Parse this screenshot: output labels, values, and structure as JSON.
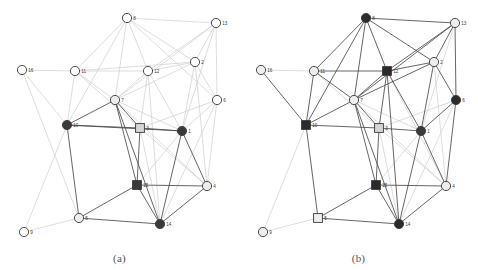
{
  "figure": {
    "panels": [
      {
        "id": "a",
        "caption": "(a)",
        "origin_x": 0,
        "nodes": [
          {
            "id": "1",
            "label": "1",
            "x": 182,
            "y": 131,
            "shape": "circle",
            "fill": "#3a3a3a"
          },
          {
            "id": "2",
            "label": "2",
            "x": 195,
            "y": 62,
            "shape": "circle",
            "fill": "#ffffff"
          },
          {
            "id": "3",
            "label": "3",
            "x": 140,
            "y": 128,
            "shape": "square",
            "fill": "#d5d5d5"
          },
          {
            "id": "4",
            "label": "4",
            "x": 207,
            "y": 186,
            "shape": "circle",
            "fill": "#ededed"
          },
          {
            "id": "5",
            "label": "5",
            "x": 79,
            "y": 218,
            "shape": "circle",
            "fill": "#ededed"
          },
          {
            "id": "6",
            "label": "6",
            "x": 217,
            "y": 100,
            "shape": "circle",
            "fill": "#ffffff"
          },
          {
            "id": "7",
            "label": "7",
            "x": 115,
            "y": 100,
            "shape": "circle",
            "fill": "#ededed"
          },
          {
            "id": "8",
            "label": "8",
            "x": 127,
            "y": 18,
            "shape": "circle",
            "fill": "#ffffff"
          },
          {
            "id": "9",
            "label": "9",
            "x": 24,
            "y": 232,
            "shape": "circle",
            "fill": "#ffffff"
          },
          {
            "id": "10",
            "label": "10",
            "x": 67,
            "y": 125,
            "shape": "circle",
            "fill": "#3a3a3a"
          },
          {
            "id": "11",
            "label": "11",
            "x": 75,
            "y": 71,
            "shape": "circle",
            "fill": "#ffffff"
          },
          {
            "id": "12",
            "label": "12",
            "x": 148,
            "y": 71,
            "shape": "circle",
            "fill": "#ffffff"
          },
          {
            "id": "13",
            "label": "13",
            "x": 216,
            "y": 23,
            "shape": "circle",
            "fill": "#ffffff"
          },
          {
            "id": "14",
            "label": "14",
            "x": 160,
            "y": 224,
            "shape": "circle",
            "fill": "#3a3a3a"
          },
          {
            "id": "15",
            "label": "15",
            "x": 137,
            "y": 185,
            "shape": "square",
            "fill": "#3a3a3a"
          },
          {
            "id": "16",
            "label": "16",
            "x": 22,
            "y": 70,
            "shape": "circle",
            "fill": "#ffffff"
          }
        ],
        "edges_strong": [
          [
            "10",
            "7"
          ],
          [
            "7",
            "3"
          ],
          [
            "3",
            "1"
          ],
          [
            "10",
            "3"
          ],
          [
            "10",
            "1"
          ],
          [
            "3",
            "15"
          ],
          [
            "7",
            "15"
          ],
          [
            "7",
            "14"
          ],
          [
            "10",
            "5"
          ],
          [
            "5",
            "15"
          ],
          [
            "15",
            "14"
          ],
          [
            "5",
            "14"
          ],
          [
            "1",
            "4"
          ],
          [
            "4",
            "14"
          ],
          [
            "15",
            "4"
          ],
          [
            "1",
            "14"
          ]
        ],
        "edges_faint": [
          [
            "8",
            "13"
          ],
          [
            "8",
            "11"
          ],
          [
            "8",
            "12"
          ],
          [
            "8",
            "7"
          ],
          [
            "8",
            "2"
          ],
          [
            "8",
            "6"
          ],
          [
            "13",
            "2"
          ],
          [
            "13",
            "6"
          ],
          [
            "13",
            "12"
          ],
          [
            "13",
            "7"
          ],
          [
            "2",
            "12"
          ],
          [
            "2",
            "6"
          ],
          [
            "2",
            "7"
          ],
          [
            "2",
            "1"
          ],
          [
            "2",
            "11"
          ],
          [
            "12",
            "7"
          ],
          [
            "12",
            "11"
          ],
          [
            "12",
            "1"
          ],
          [
            "12",
            "3"
          ],
          [
            "11",
            "16"
          ],
          [
            "11",
            "7"
          ],
          [
            "11",
            "10"
          ],
          [
            "16",
            "10"
          ],
          [
            "6",
            "1"
          ],
          [
            "6",
            "4"
          ],
          [
            "6",
            "3"
          ],
          [
            "6",
            "14"
          ],
          [
            "9",
            "5"
          ],
          [
            "9",
            "10"
          ],
          [
            "7",
            "1"
          ],
          [
            "7",
            "4"
          ],
          [
            "3",
            "14"
          ],
          [
            "3",
            "4"
          ],
          [
            "1",
            "15"
          ],
          [
            "11",
            "3"
          ],
          [
            "12",
            "14"
          ],
          [
            "13",
            "1"
          ],
          [
            "8",
            "10"
          ],
          [
            "2",
            "4"
          ],
          [
            "16",
            "5"
          ]
        ]
      },
      {
        "id": "b",
        "caption": "(b)",
        "origin_x": 239,
        "nodes": [
          {
            "id": "1",
            "label": "1",
            "x": 182,
            "y": 131,
            "shape": "circle",
            "fill": "#3a3a3a"
          },
          {
            "id": "2",
            "label": "2",
            "x": 195,
            "y": 62,
            "shape": "circle",
            "fill": "#ededed"
          },
          {
            "id": "3",
            "label": "3",
            "x": 140,
            "y": 128,
            "shape": "square",
            "fill": "#d5d5d5"
          },
          {
            "id": "4",
            "label": "4",
            "x": 207,
            "y": 186,
            "shape": "circle",
            "fill": "#ededed"
          },
          {
            "id": "5",
            "label": "5",
            "x": 79,
            "y": 218,
            "shape": "square",
            "fill": "#ededed"
          },
          {
            "id": "6",
            "label": "6",
            "x": 217,
            "y": 100,
            "shape": "circle",
            "fill": "#2b2b2b"
          },
          {
            "id": "7",
            "label": "7",
            "x": 115,
            "y": 100,
            "shape": "circle",
            "fill": "#ededed"
          },
          {
            "id": "8",
            "label": "8",
            "x": 127,
            "y": 18,
            "shape": "circle",
            "fill": "#2b2b2b"
          },
          {
            "id": "9",
            "label": "9",
            "x": 24,
            "y": 232,
            "shape": "circle",
            "fill": "#ededed"
          },
          {
            "id": "10",
            "label": "10",
            "x": 67,
            "y": 125,
            "shape": "square",
            "fill": "#2b2b2b"
          },
          {
            "id": "11",
            "label": "11",
            "x": 75,
            "y": 71,
            "shape": "circle",
            "fill": "#ededed"
          },
          {
            "id": "12",
            "label": "12",
            "x": 148,
            "y": 71,
            "shape": "square",
            "fill": "#2b2b2b"
          },
          {
            "id": "13",
            "label": "13",
            "x": 216,
            "y": 23,
            "shape": "circle",
            "fill": "#ededed"
          },
          {
            "id": "14",
            "label": "14",
            "x": 160,
            "y": 224,
            "shape": "circle",
            "fill": "#2b2b2b"
          },
          {
            "id": "15",
            "label": "15",
            "x": 137,
            "y": 185,
            "shape": "square",
            "fill": "#2b2b2b"
          },
          {
            "id": "16",
            "label": "16",
            "x": 22,
            "y": 70,
            "shape": "circle",
            "fill": "#ededed"
          }
        ],
        "edges_strong": [
          [
            "8",
            "13"
          ],
          [
            "8",
            "11"
          ],
          [
            "8",
            "12"
          ],
          [
            "8",
            "7"
          ],
          [
            "8",
            "2"
          ],
          [
            "8",
            "10"
          ],
          [
            "13",
            "2"
          ],
          [
            "13",
            "6"
          ],
          [
            "13",
            "12"
          ],
          [
            "2",
            "12"
          ],
          [
            "2",
            "6"
          ],
          [
            "2",
            "1"
          ],
          [
            "11",
            "12"
          ],
          [
            "11",
            "10"
          ],
          [
            "11",
            "7"
          ],
          [
            "12",
            "7"
          ],
          [
            "12",
            "3"
          ],
          [
            "12",
            "1"
          ],
          [
            "7",
            "10"
          ],
          [
            "7",
            "3"
          ],
          [
            "7",
            "15"
          ],
          [
            "7",
            "14"
          ],
          [
            "10",
            "3"
          ],
          [
            "10",
            "5"
          ],
          [
            "10",
            "16"
          ],
          [
            "3",
            "1"
          ],
          [
            "3",
            "15"
          ],
          [
            "6",
            "1"
          ],
          [
            "6",
            "4"
          ],
          [
            "15",
            "5"
          ],
          [
            "15",
            "14"
          ],
          [
            "15",
            "4"
          ],
          [
            "5",
            "14"
          ],
          [
            "1",
            "4"
          ],
          [
            "4",
            "14"
          ],
          [
            "1",
            "14"
          ],
          [
            "13",
            "7"
          ],
          [
            "2",
            "7"
          ],
          [
            "12",
            "14"
          ]
        ],
        "edges_faint": [
          [
            "9",
            "5"
          ],
          [
            "16",
            "11"
          ],
          [
            "6",
            "3"
          ],
          [
            "6",
            "14"
          ],
          [
            "3",
            "14"
          ],
          [
            "3",
            "4"
          ],
          [
            "1",
            "15"
          ],
          [
            "7",
            "1"
          ],
          [
            "7",
            "4"
          ],
          [
            "9",
            "10"
          ],
          [
            "2",
            "4"
          ],
          [
            "13",
            "1"
          ],
          [
            "12",
            "4"
          ],
          [
            "11",
            "3"
          ]
        ]
      }
    ]
  },
  "style": {
    "strong_edge_color": "#4a4a4a",
    "faint_edge_color": "#cfcfcf",
    "node_stroke": "#3a3a3a",
    "label_color": "#3a3a3a",
    "background": "#ffffff"
  }
}
